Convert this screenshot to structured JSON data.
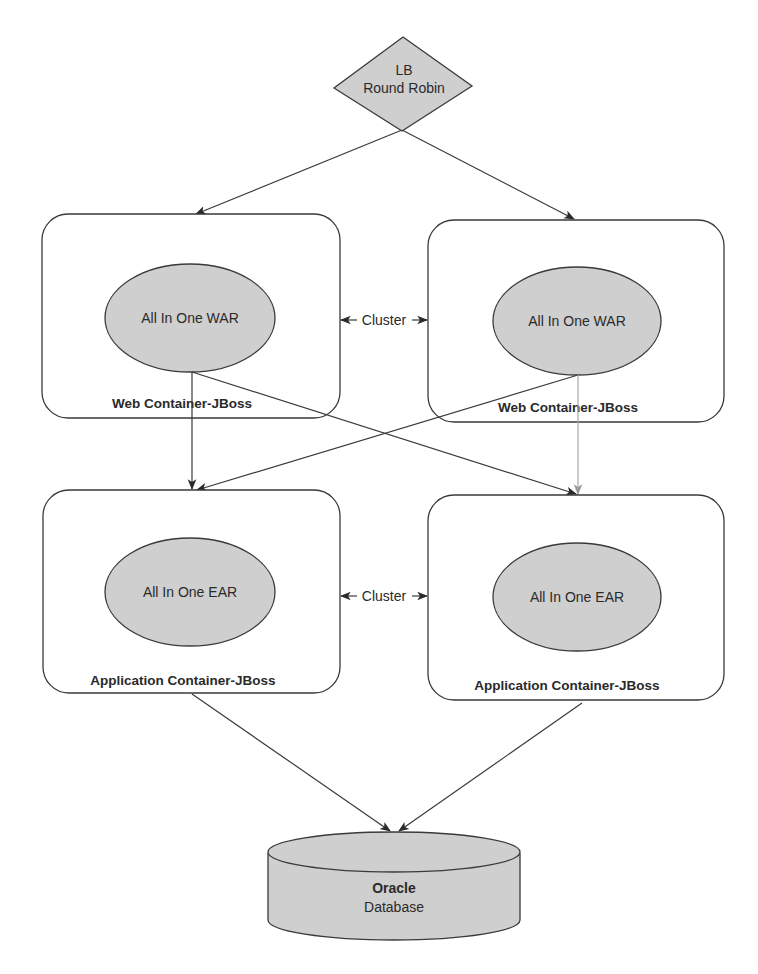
{
  "diagram": {
    "load_balancer": {
      "line1": "LB",
      "line2": "Round Robin",
      "shape": "diamond"
    },
    "web_containers": [
      {
        "label": "Web Container-JBoss",
        "artifact": "All In One WAR"
      },
      {
        "label": "Web Container-JBoss",
        "artifact": "All In One WAR"
      }
    ],
    "app_containers": [
      {
        "label": "Application Container-JBoss",
        "artifact": "All In One EAR"
      },
      {
        "label": "Application Container-JBoss",
        "artifact": "All In One EAR"
      }
    ],
    "clusters": [
      {
        "label": "Cluster",
        "between": "web_containers"
      },
      {
        "label": "Cluster",
        "between": "app_containers"
      }
    ],
    "database": {
      "title": "Oracle",
      "subtitle": "Database",
      "shape": "cylinder"
    },
    "connections": [
      {
        "from": "LB",
        "to": "web_container_1"
      },
      {
        "from": "LB",
        "to": "web_container_2"
      },
      {
        "from": "web_container_1",
        "to": "app_container_1"
      },
      {
        "from": "web_container_1",
        "to": "app_container_2"
      },
      {
        "from": "web_container_2",
        "to": "app_container_1"
      },
      {
        "from": "web_container_2",
        "to": "app_container_2"
      },
      {
        "from": "app_container_1",
        "to": "database"
      },
      {
        "from": "app_container_2",
        "to": "database"
      }
    ],
    "colors": {
      "node_fill": "#cfcfcf",
      "stroke": "#3a3a3a",
      "light_edge": "#a8a8a8",
      "background": "#ffffff"
    }
  }
}
